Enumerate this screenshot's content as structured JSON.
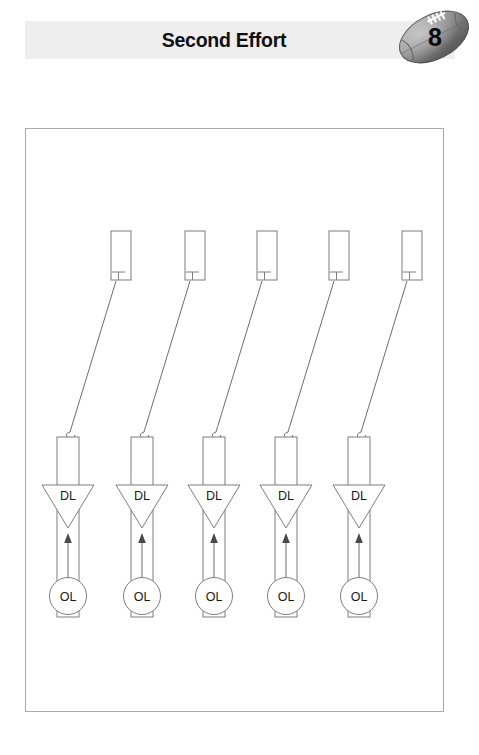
{
  "header": {
    "title": "Second Effort",
    "page_number": "8",
    "band_color": "#eeeeee",
    "football_icon": "football-icon",
    "football_color": "#8e8e8e"
  },
  "diagram": {
    "name": "football-drill-diagram",
    "border_color": "#a8a8a8",
    "stroke_color": "#7d7d7d",
    "columns": 5,
    "labels": {
      "defensive_line": "DL",
      "offensive_line": "OL"
    },
    "column_positions_px": [
      66,
      138,
      210,
      282,
      355
    ],
    "top_pad_positions_px": [
      118,
      192,
      265,
      337,
      410
    ],
    "units": [
      {
        "id": 1,
        "dl_label": "DL",
        "ol_label": "OL",
        "pad_label": ""
      },
      {
        "id": 2,
        "dl_label": "DL",
        "ol_label": "OL",
        "pad_label": ""
      },
      {
        "id": 3,
        "dl_label": "DL",
        "ol_label": "OL",
        "pad_label": ""
      },
      {
        "id": 4,
        "dl_label": "DL",
        "ol_label": "OL",
        "pad_label": ""
      },
      {
        "id": 5,
        "dl_label": "DL",
        "ol_label": "OL",
        "pad_label": ""
      }
    ]
  }
}
